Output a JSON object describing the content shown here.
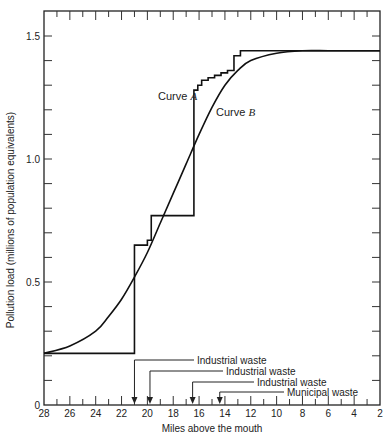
{
  "chart_data": {
    "type": "line",
    "title": "",
    "xlabel": "Miles above the mouth",
    "ylabel": "Pollution load (millions of population equivalents)",
    "xlim": [
      28,
      2
    ],
    "ylim": [
      0,
      1.6
    ],
    "x_ticks": [
      28,
      26,
      24,
      22,
      20,
      18,
      16,
      14,
      12,
      10,
      8,
      6,
      4,
      2
    ],
    "y_ticks": [
      0,
      0.5,
      1.0,
      1.5
    ],
    "y_tick_labels": [
      "0",
      "0.5",
      "1.0",
      "1.5"
    ],
    "grid": false,
    "series": [
      {
        "name": "Curve A",
        "style": "step",
        "x": [
          28,
          21.0,
          21.0,
          20.0,
          20.0,
          19.7,
          19.7,
          17.1,
          17.1,
          16.4,
          16.4,
          16.1,
          16.1,
          15.8,
          15.8,
          15.3,
          15.3,
          14.8,
          14.8,
          14.3,
          14.3,
          13.8,
          13.8,
          13.3,
          13.3,
          12.8,
          12.8,
          2
        ],
        "y": [
          0.21,
          0.21,
          0.65,
          0.65,
          0.67,
          0.67,
          0.77,
          0.77,
          0.77,
          0.77,
          1.28,
          1.28,
          1.3,
          1.3,
          1.32,
          1.32,
          1.33,
          1.33,
          1.34,
          1.34,
          1.35,
          1.35,
          1.36,
          1.36,
          1.42,
          1.42,
          1.44,
          1.44
        ]
      },
      {
        "name": "Curve B",
        "style": "smooth",
        "x": [
          28,
          26,
          24,
          23,
          22,
          21,
          20,
          19,
          18,
          17,
          16,
          15,
          14,
          13,
          12,
          10,
          8,
          6,
          4,
          2
        ],
        "y": [
          0.21,
          0.24,
          0.3,
          0.36,
          0.43,
          0.52,
          0.62,
          0.74,
          0.86,
          0.98,
          1.1,
          1.21,
          1.3,
          1.36,
          1.4,
          1.43,
          1.44,
          1.44,
          1.44,
          1.44
        ]
      }
    ],
    "annotations": [
      {
        "text": "Curve A",
        "italic_part": "A",
        "x": 16.6,
        "y": 1.25
      },
      {
        "text": "Curve B",
        "italic_part": "B",
        "x": 13.1,
        "y": 1.15
      },
      {
        "text": "Industrial waste",
        "arrow_x": 21.0,
        "label_row": 1
      },
      {
        "text": "Industrial waste",
        "arrow_x": 19.8,
        "label_row": 2
      },
      {
        "text": "Industrial waste",
        "arrow_x": 16.5,
        "label_row": 3
      },
      {
        "text": "Municipal waste",
        "arrow_x": 14.4,
        "label_row": 4
      }
    ]
  },
  "labels": {
    "xlabel": "Miles above the mouth",
    "ylabel": "Pollution load (millions of population equivalents)",
    "curve_a_prefix": "Curve ",
    "curve_a_letter": "A",
    "curve_b_prefix": "Curve ",
    "curve_b_letter": "B",
    "waste1": "Industrial waste",
    "waste2": "Industrial waste",
    "waste3": "Industrial waste",
    "waste4": "Municipal waste"
  }
}
